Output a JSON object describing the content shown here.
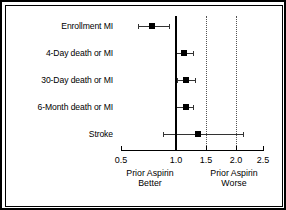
{
  "chart_data": {
    "type": "scatter",
    "title": "",
    "subtitle": "",
    "xlabel": "Odds Ratio",
    "ylabel": "",
    "xlim": [
      0.5,
      2.5
    ],
    "grid": false,
    "legend_position": "none",
    "reference_value": 1.0,
    "tick_values": [
      0.5,
      1.0,
      1.5,
      2.0,
      2.5
    ],
    "tick_labels": [
      "0.5",
      "1.0",
      "1.5",
      "2.0",
      "2.5"
    ],
    "dotted_reference_lines": [
      1.5,
      2.0
    ],
    "categories": [
      "Enrollment MI",
      "4-Day death or MI",
      "30-Day death or MI",
      "6-Month death or MI",
      "Stroke"
    ],
    "values": [
      0.78,
      1.13,
      1.16,
      1.17,
      1.37
    ],
    "ci_low": [
      0.65,
      1.0,
      1.02,
      0.99,
      0.88
    ],
    "ci_high": [
      0.94,
      1.28,
      1.31,
      1.29,
      2.13
    ],
    "series": [
      {
        "name": "Odds ratio (95% CI)",
        "points": [
          {
            "label": "Enrollment MI",
            "value": 0.78,
            "low": 0.65,
            "high": 0.94
          },
          {
            "label": "4-Day death or MI",
            "value": 1.13,
            "low": 1.0,
            "high": 1.28
          },
          {
            "label": "30-Day death or MI",
            "value": 1.16,
            "low": 1.02,
            "high": 1.31
          },
          {
            "label": "6-Month death or MI",
            "value": 1.17,
            "low": 0.99,
            "high": 1.29
          },
          {
            "label": "Stroke",
            "value": 1.37,
            "low": 0.88,
            "high": 2.13
          }
        ]
      }
    ],
    "annotations": {
      "left_label_line1": "Prior Aspirin",
      "left_label_line2": "Better",
      "right_label_line1": "Prior Aspirin",
      "right_label_line2": "Worse"
    },
    "colors": {
      "marker": "#000000",
      "whisker": "#333333",
      "reference_line": "#000000",
      "dotted_line": "#555555",
      "axis": "#000000",
      "background": "#ffffff",
      "border": "#000000"
    }
  }
}
